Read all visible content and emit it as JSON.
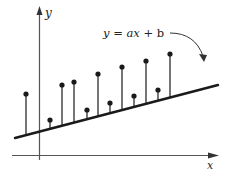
{
  "diagram": {
    "y_axis_label": "y",
    "x_axis_label": "x",
    "equation": {
      "y": "y",
      "eq": " = ",
      "ax": "ax",
      "plus": " + ",
      "b": "b"
    },
    "colors": {
      "line": "#1a1a1a",
      "axis": "#555555",
      "point": "#1a1a1a",
      "background": "#ffffff"
    }
  },
  "chart_data": {
    "type": "scatter",
    "title": "",
    "xlabel": "x",
    "ylabel": "y",
    "fit_line": {
      "equation": "y = ax + b",
      "x1": 15,
      "y1": 138,
      "x2": 218,
      "y2": 85
    },
    "points": [
      {
        "px": 26,
        "py": 94
      },
      {
        "px": 50,
        "py": 120
      },
      {
        "px": 62,
        "py": 85
      },
      {
        "px": 74,
        "py": 82
      },
      {
        "px": 87,
        "py": 110
      },
      {
        "px": 98,
        "py": 74
      },
      {
        "px": 110,
        "py": 103
      },
      {
        "px": 122,
        "py": 67
      },
      {
        "px": 134,
        "py": 96
      },
      {
        "px": 146,
        "py": 61
      },
      {
        "px": 158,
        "py": 90
      },
      {
        "px": 170,
        "py": 54
      }
    ],
    "grid": false,
    "legend": "none"
  }
}
